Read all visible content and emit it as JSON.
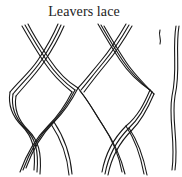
{
  "caption": "Leavers lace",
  "illustration": {
    "subject": "Leavers lace mesh line drawing",
    "ink_color": "#1a1a1a",
    "paper_color": "#ffffff"
  }
}
